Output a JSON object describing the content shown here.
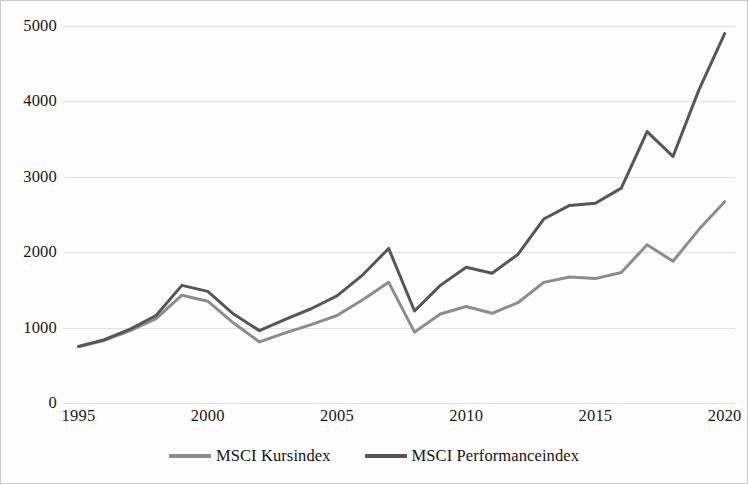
{
  "chart_data": {
    "type": "line",
    "title": "",
    "subtitle": "",
    "xlabel": "",
    "ylabel": "",
    "xlim": [
      1994.4,
      2020.4
    ],
    "ylim": [
      0,
      5000
    ],
    "grid": true,
    "grid_axis": "y",
    "legend_position": "bottom",
    "x": [
      1995,
      1996,
      1997,
      1998,
      1999,
      2000,
      2001,
      2002,
      2003,
      2004,
      2005,
      2006,
      2007,
      2008,
      2009,
      2010,
      2011,
      2012,
      2013,
      2014,
      2015,
      2016,
      2017,
      2018,
      2019,
      2020
    ],
    "xtick_labels": [
      "1995",
      "2000",
      "2005",
      "2010",
      "2015",
      "2020"
    ],
    "xtick_values": [
      1995,
      2000,
      2005,
      2010,
      2015,
      2020
    ],
    "ytick_labels": [
      "0",
      "1000",
      "2000",
      "3000",
      "4000",
      "5000"
    ],
    "ytick_values": [
      0,
      1000,
      2000,
      3000,
      4000,
      5000
    ],
    "series": [
      {
        "name": "MSCI Kursindex",
        "color": "#8c8c8c",
        "values": [
          750,
          830,
          960,
          1120,
          1430,
          1350,
          1060,
          810,
          930,
          1040,
          1160,
          1370,
          1600,
          940,
          1180,
          1280,
          1190,
          1330,
          1600,
          1670,
          1650,
          1730,
          2100,
          1880,
          2300,
          2670
        ]
      },
      {
        "name": "MSCI Performanceindex",
        "color": "#565656",
        "values": [
          750,
          840,
          980,
          1160,
          1560,
          1480,
          1180,
          960,
          1110,
          1250,
          1420,
          1700,
          2050,
          1220,
          1560,
          1800,
          1720,
          1970,
          2440,
          2620,
          2650,
          2850,
          3600,
          3270,
          4150,
          4900
        ]
      }
    ]
  },
  "legend": {
    "items": [
      {
        "label": "MSCI Kursindex",
        "color": "#8c8c8c"
      },
      {
        "label": "MSCI Performanceindex",
        "color": "#565656"
      }
    ]
  }
}
